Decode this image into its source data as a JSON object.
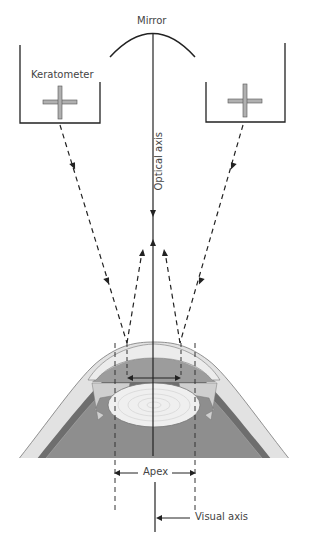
{
  "labels": {
    "mirror": "Mirror",
    "keratometer": "Keratometer",
    "optical_axis": "Optical axis",
    "apex": "Apex",
    "visual_axis": "Visual axis"
  },
  "colors": {
    "line": "#222222",
    "cornea": "#e6e6e6",
    "aqueous": "#9a9a9a",
    "lens": "#efefef",
    "vitreous": "#8c8c8c",
    "sclera": "#d4d4d4",
    "choroid": "#6e6e6e",
    "cross_fill": "#b0b0b0"
  }
}
